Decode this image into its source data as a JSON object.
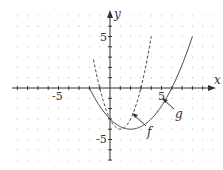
{
  "chart_data": {
    "type": "line",
    "title": "",
    "xlabel": "x",
    "ylabel": "y",
    "xlim": [
      -9.5,
      10.5
    ],
    "ylim": [
      -7,
      7.5
    ],
    "grid": "dots",
    "x_tick_labels": [
      "-5",
      "5"
    ],
    "y_tick_labels": [
      "5",
      "-5"
    ],
    "series": [
      {
        "name": "f",
        "style": "dashed",
        "formula": "(x-1)^2 - 4",
        "domain": [
          -1.6,
          4
        ],
        "points": [
          [
            -1.6,
            2.76
          ],
          [
            -1,
            0
          ],
          [
            0,
            -3
          ],
          [
            1,
            -4
          ],
          [
            2,
            -3
          ],
          [
            3,
            0
          ],
          [
            4,
            5
          ]
        ]
      },
      {
        "name": "g",
        "style": "solid",
        "formula": "(x-2)^2/4 - 4",
        "domain": [
          -2,
          8
        ],
        "points": [
          [
            -2,
            0
          ],
          [
            0,
            -3
          ],
          [
            2,
            -4
          ],
          [
            4,
            -3
          ],
          [
            6,
            0
          ],
          [
            8,
            5
          ]
        ]
      }
    ],
    "annotations": [
      {
        "text": "f",
        "points_to": [
          2,
          -2.6
        ]
      },
      {
        "text": "g",
        "points_to": [
          5,
          -1.7
        ]
      }
    ]
  },
  "labels": {
    "x_axis": "x",
    "y_axis": "y",
    "tick_neg5": "-5",
    "tick_pos5": "5",
    "tick_y5": "5",
    "tick_yneg5": "-5",
    "f": "f",
    "g": "g"
  }
}
